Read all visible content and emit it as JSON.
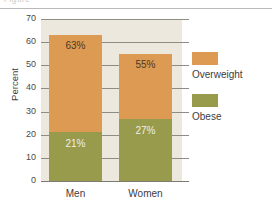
{
  "header": {
    "clipped_title": "Figure"
  },
  "chart_data": {
    "type": "bar",
    "subtype": "stacked",
    "title": "",
    "xlabel": "",
    "ylabel": "Percent",
    "ylim": [
      0,
      70
    ],
    "ytick_values": [
      70,
      60,
      50,
      40,
      30,
      20,
      10,
      0
    ],
    "yticks": [
      "70",
      "60",
      "50",
      "40",
      "30",
      "20",
      "10",
      "0"
    ],
    "categories": [
      "Men",
      "Women"
    ],
    "grid": true,
    "legend_position": "right",
    "series": [
      {
        "name": "Overweight",
        "color": "#dd9a53",
        "values": [
          63,
          55
        ],
        "labels": [
          "63%",
          "55%"
        ]
      },
      {
        "name": "Obese",
        "color": "#989a4c",
        "values": [
          21,
          27
        ],
        "labels": [
          "21%",
          "27%"
        ]
      }
    ],
    "colors": {
      "overweight": "#dd9a53",
      "obese": "#989a4c",
      "plot_background": "#ece8de",
      "page_background": "#ffffff",
      "gridline": "#8f8c84"
    }
  }
}
